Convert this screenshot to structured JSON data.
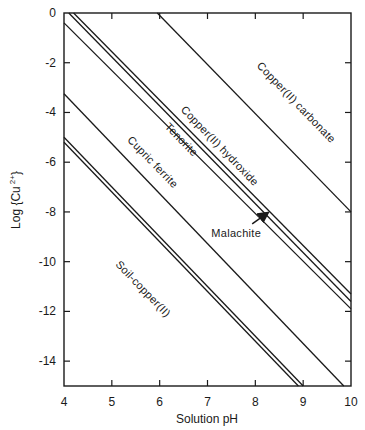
{
  "chart_data": {
    "type": "line",
    "title": "",
    "xlabel": "Solution pH",
    "ylabel": "Log {Cu 2+}",
    "ylabel_main": "Log {Cu",
    "ylabel_sup": "2+",
    "ylabel_close": "}",
    "xlim": [
      4,
      10
    ],
    "ylim": [
      -15,
      0
    ],
    "xticks": [
      4,
      5,
      6,
      7,
      8,
      9,
      10
    ],
    "yticks": [
      0,
      -2,
      -4,
      -6,
      -8,
      -10,
      -12,
      -14
    ],
    "ytick_labels": [
      "0",
      "-2",
      "-4",
      "-6",
      "-8",
      "-10",
      "-12",
      "-14"
    ],
    "grid": false,
    "legend": "none (inline labels)",
    "series": [
      {
        "name": "Copper(II) carbonate",
        "x": [
          5.95,
          10
        ],
        "y": [
          0,
          -8.0
        ]
      },
      {
        "name": "Copper(II) hydroxide",
        "x": [
          4.2,
          10
        ],
        "y": [
          0,
          -11.3
        ]
      },
      {
        "name": "Malachite",
        "x": [
          4.1,
          10
        ],
        "y": [
          0,
          -11.6
        ]
      },
      {
        "name": "Tenorite",
        "x": [
          4,
          10
        ],
        "y": [
          -0.4,
          -11.9
        ]
      },
      {
        "name": "Cupric ferrite",
        "x": [
          4,
          9.85
        ],
        "y": [
          -3.25,
          -15
        ]
      },
      {
        "name": "Soil-copper(II)",
        "x": [
          4,
          9.0
        ],
        "y": [
          -5.0,
          -15
        ]
      },
      {
        "name": "Soil-copper(II) (lower)",
        "x": [
          4,
          8.9
        ],
        "y": [
          -5.2,
          -15
        ]
      }
    ],
    "annotations": [
      {
        "text": "Copper(II) carbonate",
        "x": 8.8,
        "y": -3.7,
        "rotation": -46
      },
      {
        "text": "Copper(II) hydroxide",
        "x": 7.2,
        "y": -5.45,
        "rotation": -46
      },
      {
        "text": "Tenorite",
        "x": 6.4,
        "y": -5.2,
        "rotation": -46
      },
      {
        "text": "Cupric ferrite",
        "x": 5.8,
        "y": -6.1,
        "rotation": -46
      },
      {
        "text": "Soil-copper(II)",
        "x": 5.6,
        "y": -11.2,
        "rotation": -46
      },
      {
        "text": "Malachite",
        "x": 7.6,
        "y": -9.0,
        "rotation": 0,
        "arrow_to": [
          8.25,
          -8.05
        ]
      }
    ]
  }
}
